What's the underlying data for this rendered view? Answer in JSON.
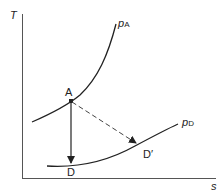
{
  "diagram": {
    "axes": {
      "y_label": "T",
      "x_label": "s"
    },
    "curves": [
      {
        "name": "p",
        "subscript": "A"
      },
      {
        "name": "p",
        "subscript": "D"
      }
    ],
    "points": {
      "A": "A",
      "D": "D",
      "D_prime": "D′"
    },
    "arrows": [
      {
        "from": "A",
        "to": "D",
        "style": "solid"
      },
      {
        "from": "A",
        "to": "D′",
        "style": "dashed"
      }
    ]
  }
}
